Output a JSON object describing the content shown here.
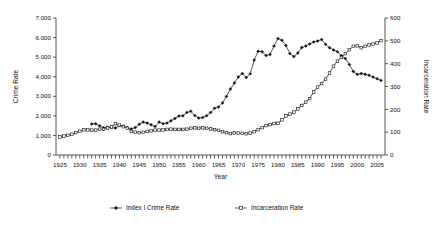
{
  "chart_data": {
    "type": "line",
    "title": "",
    "xlabel": "Year",
    "ylabel": "Crime Rate",
    "y2label": "Incarceration Rate",
    "xlim": [
      1924,
      2007
    ],
    "ylim": [
      0,
      7000
    ],
    "y2lim": [
      0,
      600
    ],
    "x_tick_step": 1,
    "x_label_step": 5,
    "y_ticks": [
      "0",
      "1,000",
      "2,000",
      "3,000",
      "4,000",
      "5,000",
      "6,000",
      "7,000"
    ],
    "y_tick_values": [
      0,
      1000,
      2000,
      3000,
      4000,
      5000,
      6000,
      7000
    ],
    "y2_ticks": [
      "0",
      "100",
      "200",
      "300",
      "400",
      "500",
      "600"
    ],
    "y2_tick_values": [
      0,
      100,
      200,
      300,
      400,
      500,
      600
    ],
    "x_tick_labels": [
      "1925",
      "1930",
      "1935",
      "1940",
      "1945",
      "1950",
      "1955",
      "1960",
      "1965",
      "1970",
      "1975",
      "1980",
      "1985",
      "1990",
      "1995",
      "2000",
      "2005"
    ],
    "grid": false,
    "legend_position": "bottom",
    "series": [
      {
        "name": "Index I Crime Rate",
        "axis": "left",
        "marker": "filled-diamond",
        "x": [
          1933,
          1934,
          1935,
          1936,
          1937,
          1938,
          1939,
          1940,
          1941,
          1942,
          1943,
          1944,
          1945,
          1946,
          1947,
          1948,
          1949,
          1950,
          1951,
          1952,
          1953,
          1954,
          1955,
          1956,
          1957,
          1958,
          1959,
          1960,
          1961,
          1962,
          1963,
          1964,
          1965,
          1966,
          1967,
          1968,
          1969,
          1970,
          1971,
          1972,
          1973,
          1974,
          1975,
          1976,
          1977,
          1978,
          1979,
          1980,
          1981,
          1982,
          1983,
          1984,
          1985,
          1986,
          1987,
          1988,
          1989,
          1990,
          1991,
          1992,
          1993,
          1994,
          1995,
          1996,
          1997,
          1998,
          1999,
          2000,
          2001,
          2002,
          2003,
          2004,
          2005,
          2006
        ],
        "values": [
          1580,
          1600,
          1490,
          1390,
          1420,
          1400,
          1380,
          1500,
          1480,
          1400,
          1330,
          1400,
          1570,
          1680,
          1630,
          1550,
          1450,
          1680,
          1600,
          1630,
          1750,
          1870,
          1990,
          2000,
          2170,
          2240,
          2020,
          1890,
          1910,
          2010,
          2170,
          2390,
          2450,
          2660,
          2990,
          3370,
          3680,
          3990,
          4160,
          3960,
          4150,
          4850,
          5300,
          5270,
          5080,
          5140,
          5570,
          5950,
          5860,
          5600,
          5180,
          5030,
          5210,
          5490,
          5570,
          5670,
          5780,
          5820,
          5900,
          5660,
          5480,
          5370,
          5280,
          5080,
          4930,
          4620,
          4270,
          4120,
          4160,
          4120,
          4070,
          3980,
          3900,
          3810
        ]
      },
      {
        "name": "Incarceration Rate",
        "axis": "right",
        "marker": "open-square",
        "x": [
          1925,
          1926,
          1927,
          1928,
          1929,
          1930,
          1931,
          1932,
          1933,
          1934,
          1935,
          1936,
          1937,
          1938,
          1939,
          1940,
          1941,
          1942,
          1943,
          1944,
          1945,
          1946,
          1947,
          1948,
          1949,
          1950,
          1951,
          1952,
          1953,
          1954,
          1955,
          1956,
          1957,
          1958,
          1959,
          1960,
          1961,
          1962,
          1963,
          1964,
          1965,
          1966,
          1967,
          1968,
          1969,
          1970,
          1971,
          1972,
          1973,
          1974,
          1975,
          1976,
          1977,
          1978,
          1979,
          1980,
          1981,
          1982,
          1983,
          1984,
          1985,
          1986,
          1987,
          1988,
          1989,
          1990,
          1991,
          1992,
          1993,
          1994,
          1995,
          1996,
          1997,
          1998,
          1999,
          2000,
          2001,
          2002,
          2003,
          2004,
          2005,
          2006
        ],
        "values": [
          79,
          83,
          86,
          91,
          98,
          104,
          110,
          110,
          109,
          109,
          113,
          113,
          118,
          123,
          137,
          131,
          124,
          117,
          103,
          100,
          98,
          99,
          103,
          106,
          109,
          109,
          110,
          112,
          113,
          112,
          112,
          112,
          113,
          117,
          119,
          117,
          119,
          117,
          114,
          111,
          108,
          102,
          98,
          94,
          97,
          96,
          95,
          93,
          96,
          102,
          111,
          120,
          129,
          133,
          138,
          139,
          154,
          171,
          179,
          188,
          202,
          217,
          231,
          247,
          276,
          297,
          313,
          332,
          359,
          389,
          411,
          427,
          444,
          461,
          476,
          478,
          470,
          476,
          482,
          486,
          491,
          501
        ]
      }
    ],
    "legend": [
      {
        "label": "Index I Crime Rate",
        "marker": "filled-diamond"
      },
      {
        "label": "Incarceration Rate",
        "marker": "open-square"
      }
    ]
  }
}
